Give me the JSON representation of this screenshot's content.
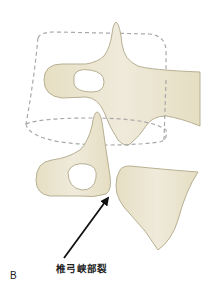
{
  "figure": {
    "panel_label": "B",
    "annotation_label": "椎弓峡部裂",
    "colors": {
      "bone_fill": "#e9e3c9",
      "bone_stroke": "#b7b093",
      "dashed_outline": "#a9a9a9",
      "arrow": "#111111",
      "background": "#ffffff"
    }
  }
}
